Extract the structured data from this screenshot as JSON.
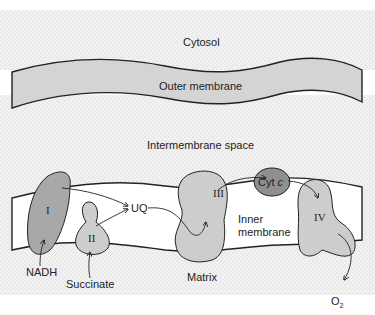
{
  "diagram": {
    "type": "mitochondrial electron transport chain",
    "regions": {
      "cytosol": "Cytosol",
      "outer_membrane": "Outer membrane",
      "intermembrane_space": "Intermembrane space",
      "inner_membrane_line1": "Inner",
      "inner_membrane_line2": "membrane",
      "matrix": "Matrix"
    },
    "complexes": {
      "complex_1": "I",
      "complex_2": "II",
      "complex_3": "III",
      "complex_4": "IV"
    },
    "carriers": {
      "ubiquinone": "UQ",
      "cytochrome_c_prefix": "Cyt ",
      "cytochrome_c_suffix": "c"
    },
    "substrates": {
      "nadh": "NADH",
      "succinate": "Succinate",
      "oxygen": "O",
      "oxygen_subscript": "2"
    },
    "colors": {
      "background_stipple": "#e6e6e6",
      "membrane_fill": "#d4d4d4",
      "complex_1_fill": "#a8a8a8",
      "complex_fill": "#cdcdcd",
      "cyt_c_fill": "#8f8f8f",
      "stroke": "#222222"
    }
  }
}
